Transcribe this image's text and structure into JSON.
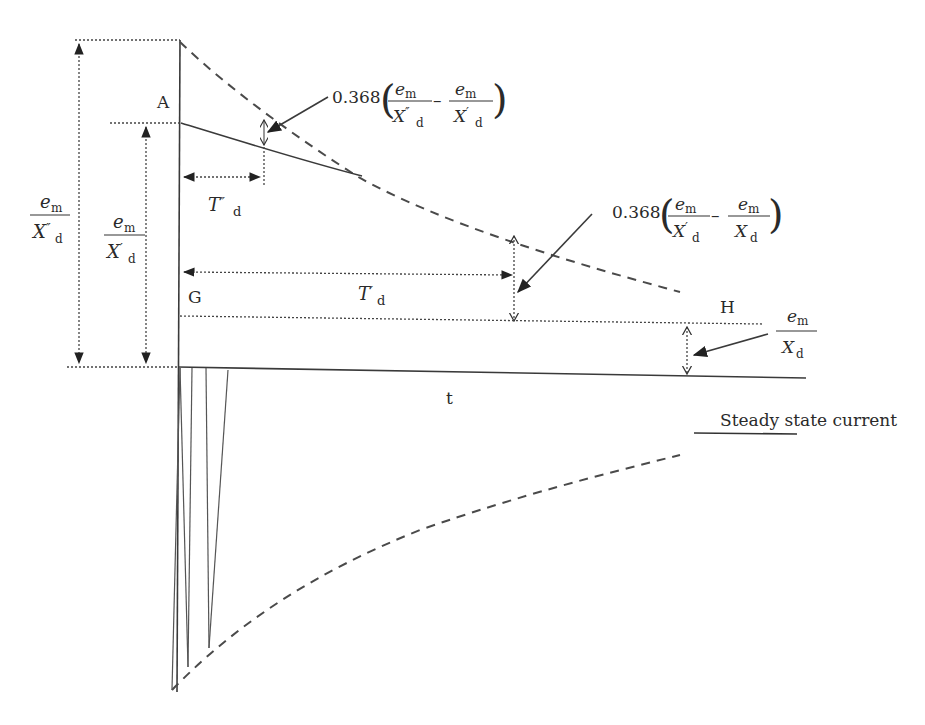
{
  "diagram": {
    "type": "transient short-circuit current of synchronous generator",
    "point_labels": {
      "A": "A",
      "G": "G",
      "H": "H"
    },
    "axis": {
      "time_label": "t"
    },
    "time_constants": {
      "subtransient": {
        "symbol": "T",
        "primes": "″",
        "subscript": "d"
      },
      "transient": {
        "symbol": "T",
        "primes": "′",
        "subscript": "d"
      }
    },
    "left_labels": {
      "subtransient_current": {
        "numerator": "e",
        "num_sub": "m",
        "denominator": "X",
        "den_primes": "″",
        "den_sub": "d"
      },
      "transient_current": {
        "numerator": "e",
        "num_sub": "m",
        "denominator": "X",
        "den_primes": "′",
        "den_sub": "d"
      }
    },
    "annotations": {
      "subtransient_decay": {
        "coefficient": "0.368",
        "term1": {
          "numerator": "e",
          "num_sub": "m",
          "denominator": "X",
          "den_primes": "″",
          "den_sub": "d"
        },
        "minus": "–",
        "term2": {
          "numerator": "e",
          "num_sub": "m",
          "denominator": "X",
          "den_primes": "′",
          "den_sub": "d"
        }
      },
      "transient_decay": {
        "coefficient": "0.368",
        "term1": {
          "numerator": "e",
          "num_sub": "m",
          "denominator": "X",
          "den_primes": "′",
          "den_sub": "d"
        },
        "minus": "–",
        "term2": {
          "numerator": "e",
          "num_sub": "m",
          "denominator": "X",
          "den_primes": "",
          "den_sub": "d"
        }
      },
      "steady_state": {
        "numerator": "e",
        "num_sub": "m",
        "denominator": "X",
        "den_primes": "",
        "den_sub": "d"
      }
    },
    "legend": {
      "steady_state_label": "Steady state current"
    }
  }
}
